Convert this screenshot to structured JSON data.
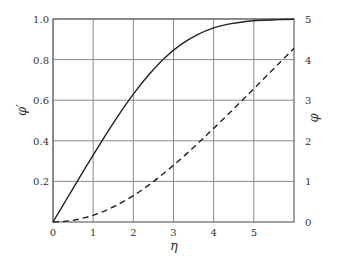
{
  "chart_data": {
    "type": "line",
    "title": "",
    "xlabel": "η",
    "ylabel_left": "φ′",
    "ylabel_right": "φ",
    "xlim": [
      0,
      6
    ],
    "ylim_left": [
      0,
      1.0
    ],
    "ylim_right": [
      0,
      5
    ],
    "grid": true,
    "legend": null,
    "x_ticks": [
      "0",
      "1",
      "2",
      "3",
      "4",
      "5"
    ],
    "y_ticks_left": [
      "0.2",
      "0.4",
      "0.6",
      "0.8",
      "1.0"
    ],
    "y_ticks_right": [
      "0",
      "1",
      "2",
      "3",
      "4",
      "5"
    ],
    "series": [
      {
        "name": "φ′ (solid, left axis)",
        "axis": "left",
        "style": "solid",
        "x": [
          0,
          0.4,
          0.8,
          1.2,
          1.6,
          2.0,
          2.4,
          2.8,
          3.2,
          3.6,
          4.0,
          4.4,
          4.8,
          5.2,
          5.6,
          6.0
        ],
        "values": [
          0,
          0.133,
          0.265,
          0.394,
          0.517,
          0.63,
          0.729,
          0.812,
          0.876,
          0.923,
          0.956,
          0.976,
          0.988,
          0.994,
          0.997,
          0.999
        ]
      },
      {
        "name": "φ (dashed, right axis)",
        "axis": "right",
        "style": "dashed",
        "x": [
          0,
          0.4,
          0.8,
          1.2,
          1.6,
          2.0,
          2.4,
          2.8,
          3.2,
          3.6,
          4.0,
          4.4,
          4.8,
          5.2,
          5.6,
          6.0
        ],
        "values": [
          0,
          0.027,
          0.106,
          0.238,
          0.42,
          0.65,
          0.922,
          1.231,
          1.569,
          1.93,
          2.306,
          2.692,
          3.085,
          3.482,
          3.88,
          4.28
        ]
      }
    ]
  }
}
